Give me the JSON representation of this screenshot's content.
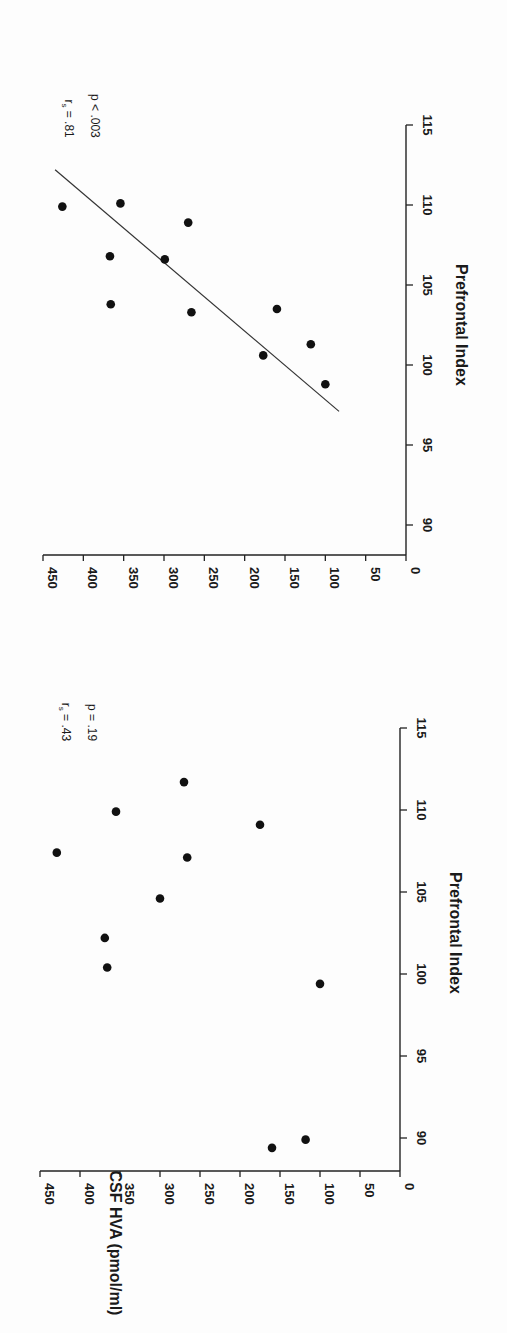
{
  "chart_data": [
    {
      "type": "scatter",
      "panel": "top",
      "rotation_deg": 90,
      "title": "",
      "xlabel": "Prefrontal Index",
      "ylabel": "",
      "xlim": [
        88,
        115
      ],
      "ylim": [
        0,
        450
      ],
      "x_ticks": [
        90,
        95,
        100,
        105,
        110,
        115
      ],
      "y_ticks": [
        0,
        50,
        100,
        150,
        200,
        250,
        300,
        350,
        400,
        450
      ],
      "grid": false,
      "annotations": {
        "r_label": "r",
        "r_sub": "s",
        "r_value": " = .81",
        "p_text": "p < .003"
      },
      "points": [
        {
          "x": 109.9,
          "y": 426
        },
        {
          "x": 110.1,
          "y": 354
        },
        {
          "x": 108.9,
          "y": 270
        },
        {
          "x": 106.8,
          "y": 367
        },
        {
          "x": 106.6,
          "y": 299
        },
        {
          "x": 103.8,
          "y": 366
        },
        {
          "x": 103.3,
          "y": 266
        },
        {
          "x": 103.5,
          "y": 160
        },
        {
          "x": 100.6,
          "y": 177
        },
        {
          "x": 101.3,
          "y": 118
        },
        {
          "x": 98.8,
          "y": 100
        }
      ],
      "regression_line": {
        "x1": 97.1,
        "y1": 83,
        "x2": 112.2,
        "y2": 435
      }
    },
    {
      "type": "scatter",
      "panel": "bottom",
      "rotation_deg": 90,
      "title": "",
      "xlabel": "Prefrontal Index",
      "ylabel": "CSF  HVA (pmol/ml)",
      "xlim": [
        88,
        115
      ],
      "ylim": [
        0,
        450
      ],
      "x_ticks": [
        90,
        95,
        100,
        105,
        110,
        115
      ],
      "y_ticks": [
        0,
        50,
        100,
        150,
        200,
        250,
        300,
        350,
        400,
        450
      ],
      "grid": false,
      "annotations": {
        "r_label": "r",
        "r_sub": "s",
        "r_value": " = .43",
        "p_text": "p = .19"
      },
      "points": [
        {
          "x": 107.4,
          "y": 429
        },
        {
          "x": 109.9,
          "y": 355
        },
        {
          "x": 111.7,
          "y": 270
        },
        {
          "x": 109.1,
          "y": 175
        },
        {
          "x": 107.1,
          "y": 266
        },
        {
          "x": 104.6,
          "y": 300
        },
        {
          "x": 102.2,
          "y": 369
        },
        {
          "x": 100.4,
          "y": 366
        },
        {
          "x": 99.4,
          "y": 100
        },
        {
          "x": 89.4,
          "y": 160
        },
        {
          "x": 89.9,
          "y": 118
        }
      ],
      "regression_line": null
    }
  ],
  "layout": {
    "panels": [
      {
        "x0_px": 406,
        "x450_px": 43,
        "axis_y_px": 555,
        "y90_px": 525,
        "px_per_unit": 16,
        "axis_top_px": 125
      },
      {
        "x0_px": 400,
        "x450_px": 40,
        "axis_y_px": 1171,
        "y90_px": 1138,
        "px_per_unit": 16.4,
        "axis_top_px": 728
      }
    ]
  }
}
